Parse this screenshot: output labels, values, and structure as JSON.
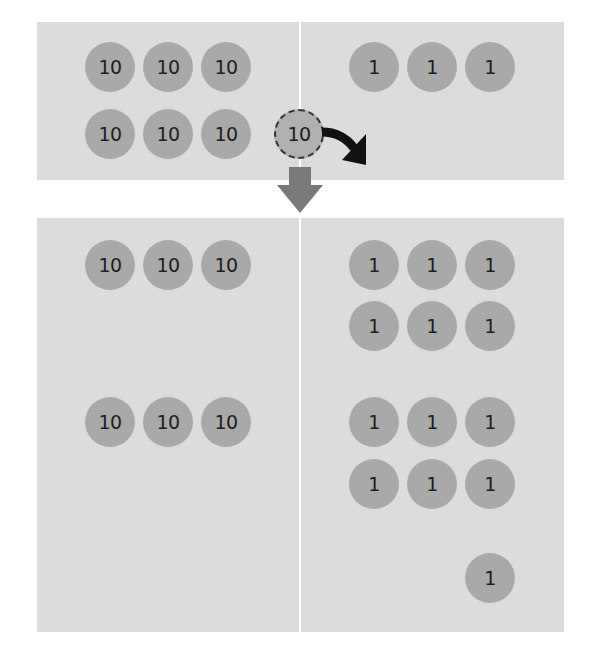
{
  "diagram": {
    "colors": {
      "panel": "#dcdcdc",
      "chip": "#a9a9a9",
      "chip_text": "#1e1e1e",
      "curved_arrow": "#111111",
      "down_arrow": "#7a7a7a"
    },
    "before": {
      "tens_column": {
        "chips": [
          "10",
          "10",
          "10",
          "10",
          "10",
          "10"
        ]
      },
      "ones_column": {
        "chips": [
          "1",
          "1",
          "1"
        ]
      },
      "moving_chip": {
        "label": "10",
        "style": "dashed"
      }
    },
    "after": {
      "tens_column": {
        "chips": [
          "10",
          "10",
          "10",
          "10",
          "10",
          "10"
        ]
      },
      "ones_column": {
        "chips": [
          "1",
          "1",
          "1",
          "1",
          "1",
          "1",
          "1",
          "1",
          "1",
          "1",
          "1",
          "1",
          "1"
        ]
      }
    }
  }
}
